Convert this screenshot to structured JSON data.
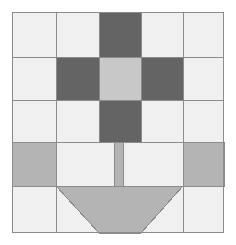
{
  "figure": {
    "type": "quilt-block-diagram",
    "canvas": {
      "width": 236,
      "height": 245,
      "background": "#ffffff"
    }
  },
  "palette": {
    "background": "#ffffff",
    "block_background": "#f0f0f0",
    "light_gray": "#c8c8c8",
    "medium_gray": "#b4b4b4",
    "dark_gray": "#646464",
    "outline": "#8c8c8c",
    "border": "#8c8c8c"
  },
  "block": {
    "x": 12,
    "y": 12,
    "width": 212,
    "height": 221,
    "fill": "#f0f0f0",
    "stroke": "#8c8c8c",
    "stroke_width": 1
  },
  "grid": {
    "columns_x": [
      12,
      56,
      99,
      141,
      183,
      224
    ],
    "rows_y": [
      12,
      57,
      100,
      142,
      186,
      233
    ],
    "stroke": "#8c8c8c",
    "stroke_width": 1
  },
  "shapes": [
    {
      "name": "nine-patch-top-center",
      "kind": "rect",
      "x": 99,
      "y": 12,
      "width": 42,
      "height": 45,
      "fill": "#646464",
      "stroke": "#8c8c8c"
    },
    {
      "name": "nine-patch-middle-left",
      "kind": "rect",
      "x": 56,
      "y": 57,
      "width": 43,
      "height": 43,
      "fill": "#646464",
      "stroke": "#8c8c8c"
    },
    {
      "name": "nine-patch-center",
      "kind": "rect",
      "x": 99,
      "y": 57,
      "width": 42,
      "height": 43,
      "fill": "#c8c8c8",
      "stroke": "#8c8c8c"
    },
    {
      "name": "nine-patch-middle-right",
      "kind": "rect",
      "x": 141,
      "y": 57,
      "width": 42,
      "height": 43,
      "fill": "#646464",
      "stroke": "#8c8c8c"
    },
    {
      "name": "nine-patch-bottom-center",
      "kind": "rect",
      "x": 99,
      "y": 100,
      "width": 42,
      "height": 42,
      "fill": "#646464",
      "stroke": "#8c8c8c"
    },
    {
      "name": "nine-patch-top-left-blank",
      "kind": "rect",
      "x": 56,
      "y": 12,
      "width": 43,
      "height": 45,
      "fill": "#f0f0f0",
      "stroke": "#8c8c8c"
    },
    {
      "name": "nine-patch-top-right-blank",
      "kind": "rect",
      "x": 141,
      "y": 12,
      "width": 42,
      "height": 45,
      "fill": "#f0f0f0",
      "stroke": "#8c8c8c"
    },
    {
      "name": "nine-patch-bottom-left-blank",
      "kind": "rect",
      "x": 56,
      "y": 100,
      "width": 43,
      "height": 42,
      "fill": "#f0f0f0",
      "stroke": "#8c8c8c"
    },
    {
      "name": "nine-patch-bottom-right-blank",
      "kind": "rect",
      "x": 141,
      "y": 100,
      "width": 42,
      "height": 42,
      "fill": "#f0f0f0",
      "stroke": "#8c8c8c"
    },
    {
      "name": "sash-band-left",
      "kind": "rect",
      "x": 12,
      "y": 142,
      "width": 44,
      "height": 44,
      "fill": "#b4b4b4",
      "stroke": "#8c8c8c"
    },
    {
      "name": "sash-band-right",
      "kind": "rect",
      "x": 183,
      "y": 142,
      "width": 41,
      "height": 44,
      "fill": "#b4b4b4",
      "stroke": "#8c8c8c"
    },
    {
      "name": "sash-block-left-light",
      "kind": "rect",
      "x": 56,
      "y": 142,
      "width": 58,
      "height": 44,
      "fill": "#f0f0f0",
      "stroke": "#8c8c8c"
    },
    {
      "name": "handle-stem",
      "kind": "rect",
      "x": 114,
      "y": 142,
      "width": 9,
      "height": 44,
      "fill": "#b4b4b4",
      "stroke": "#8c8c8c"
    },
    {
      "name": "sash-block-right-light",
      "kind": "rect",
      "x": 123,
      "y": 142,
      "width": 60,
      "height": 44,
      "fill": "#f0f0f0",
      "stroke": "#8c8c8c"
    },
    {
      "name": "basket-trapezoid",
      "kind": "polygon",
      "points": "56,186 183,186 141,233 99,233",
      "fill": "#b4b4b4",
      "stroke": "#8c8c8c"
    }
  ],
  "legend": {
    "entries": [
      {
        "label": "Dark gray patch",
        "color": "#646464"
      },
      {
        "label": "Light gray patch",
        "color": "#c8c8c8"
      },
      {
        "label": "Medium gray patch",
        "color": "#b4b4b4"
      },
      {
        "label": "Background patch",
        "color": "#f0f0f0"
      }
    ],
    "visible": false
  }
}
